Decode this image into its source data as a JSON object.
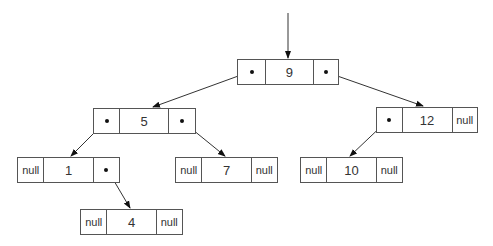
{
  "diagram": {
    "type": "binary-tree",
    "null_label": "null",
    "nodes": [
      {
        "id": "n9",
        "value": "9",
        "left": "pointer",
        "right": "pointer",
        "x": 237,
        "y": 59,
        "cells": [
          28,
          48,
          26
        ]
      },
      {
        "id": "n5",
        "value": "5",
        "left": "pointer",
        "right": "pointer",
        "x": 93,
        "y": 108,
        "cells": [
          26,
          49,
          28
        ]
      },
      {
        "id": "n12",
        "value": "12",
        "left": "pointer",
        "right": "null",
        "x": 376,
        "y": 107,
        "cells": [
          25,
          51,
          26
        ]
      },
      {
        "id": "n1",
        "value": "1",
        "left": "null",
        "right": "pointer",
        "x": 17,
        "y": 157,
        "cells": [
          26,
          50,
          27
        ]
      },
      {
        "id": "n7",
        "value": "7",
        "left": "null",
        "right": "null",
        "x": 175,
        "y": 157,
        "cells": [
          26,
          50,
          27
        ]
      },
      {
        "id": "n10",
        "value": "10",
        "left": "null",
        "right": "null",
        "x": 300,
        "y": 157,
        "cells": [
          26,
          50,
          27
        ]
      },
      {
        "id": "n4",
        "value": "4",
        "left": "null",
        "right": "null",
        "x": 80,
        "y": 209,
        "cells": [
          26,
          50,
          27
        ]
      }
    ],
    "node_height": 26,
    "edges": [
      {
        "from": "root-pointer",
        "to": "n9",
        "x1": 288,
        "y1": 13,
        "x2": 288,
        "y2": 58
      },
      {
        "from": "n9.left",
        "to": "n5",
        "x1": 252,
        "y1": 71,
        "x2": 153,
        "y2": 107
      },
      {
        "from": "n9.right",
        "to": "n12",
        "x1": 326,
        "y1": 72,
        "x2": 423,
        "y2": 106
      },
      {
        "from": "n5.left",
        "to": "n1",
        "x1": 107,
        "y1": 120,
        "x2": 71,
        "y2": 156
      },
      {
        "from": "n5.right",
        "to": "n7",
        "x1": 182,
        "y1": 121,
        "x2": 225,
        "y2": 156
      },
      {
        "from": "n12.left",
        "to": "n10",
        "x1": 389,
        "y1": 119,
        "x2": 350,
        "y2": 156
      },
      {
        "from": "n1.right",
        "to": "n4",
        "x1": 107,
        "y1": 169,
        "x2": 130,
        "y2": 208
      }
    ],
    "colors": {
      "line": "#333333",
      "border": "#555555",
      "text": "#333333"
    }
  }
}
